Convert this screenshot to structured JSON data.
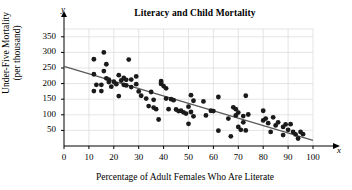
{
  "chart_data": {
    "type": "scatter",
    "title": "Literacy and Child Mortality",
    "xlabel": "Percentage of Adult Females Who Are Literate",
    "ylabel_line1": "Under-Five Mortality",
    "ylabel_line2": "(per thousand)",
    "x_axis_name": "x",
    "y_axis_name": "y",
    "xlim": [
      0,
      100
    ],
    "ylim": [
      0,
      375
    ],
    "xticks": [
      0,
      10,
      20,
      30,
      40,
      50,
      60,
      70,
      80,
      90,
      100
    ],
    "xtick_labels": [
      "0",
      "10",
      "20",
      "30",
      "40",
      "50",
      "60",
      "70",
      "80",
      "90",
      "100"
    ],
    "yticks": [
      50,
      100,
      150,
      200,
      250,
      300,
      350
    ],
    "ytick_labels": [
      "50",
      "100",
      "150",
      "200",
      "250",
      "300",
      "350"
    ],
    "y_origin_label": "0",
    "grid": true,
    "grid_color": "#d9d9d9",
    "point_color": "#1a1a1a",
    "point_radius": 2.4,
    "trendline": {
      "label": "least-squares regression line",
      "color": "#595959",
      "x_start": 0,
      "y_start": 255,
      "x_end": 100,
      "y_end": 18
    },
    "points": [
      [
        12,
        278
      ],
      [
        12,
        176
      ],
      [
        12,
        230
      ],
      [
        13,
        196
      ],
      [
        15,
        196
      ],
      [
        15,
        176
      ],
      [
        16,
        300
      ],
      [
        16,
        240
      ],
      [
        17,
        262
      ],
      [
        17,
        217
      ],
      [
        18,
        213
      ],
      [
        18,
        205
      ],
      [
        19,
        190
      ],
      [
        20,
        206
      ],
      [
        21,
        198
      ],
      [
        22,
        160
      ],
      [
        22,
        227
      ],
      [
        23,
        210
      ],
      [
        24,
        218
      ],
      [
        24,
        196
      ],
      [
        25,
        212
      ],
      [
        25,
        194
      ],
      [
        26,
        277
      ],
      [
        27,
        213
      ],
      [
        27,
        189
      ],
      [
        29,
        223
      ],
      [
        29,
        198
      ],
      [
        30,
        175
      ],
      [
        31,
        161
      ],
      [
        33,
        152
      ],
      [
        34,
        128
      ],
      [
        35,
        173
      ],
      [
        36,
        148
      ],
      [
        36,
        123
      ],
      [
        37,
        118
      ],
      [
        38,
        85
      ],
      [
        39,
        208
      ],
      [
        39,
        199
      ],
      [
        39,
        203
      ],
      [
        40,
        192
      ],
      [
        41,
        185
      ],
      [
        41,
        152
      ],
      [
        42,
        118
      ],
      [
        43,
        150
      ],
      [
        44,
        147
      ],
      [
        45,
        117
      ],
      [
        46,
        112
      ],
      [
        47,
        113
      ],
      [
        48,
        108
      ],
      [
        49,
        104
      ],
      [
        50,
        126
      ],
      [
        50,
        71
      ],
      [
        51,
        163
      ],
      [
        51,
        109
      ],
      [
        52,
        145
      ],
      [
        52,
        95
      ],
      [
        56,
        143
      ],
      [
        57,
        98
      ],
      [
        59,
        113
      ],
      [
        60,
        112
      ],
      [
        62,
        157
      ],
      [
        62,
        49
      ],
      [
        66,
        88
      ],
      [
        67,
        31
      ],
      [
        68,
        124
      ],
      [
        69,
        118
      ],
      [
        69,
        98
      ],
      [
        70,
        107
      ],
      [
        70,
        61
      ],
      [
        71,
        52
      ],
      [
        72,
        76
      ],
      [
        72,
        96
      ],
      [
        73,
        161
      ],
      [
        73,
        50
      ],
      [
        74,
        101
      ],
      [
        80,
        113
      ],
      [
        80,
        82
      ],
      [
        81,
        88
      ],
      [
        82,
        73
      ],
      [
        83,
        45
      ],
      [
        84,
        92
      ],
      [
        85,
        66
      ],
      [
        86,
        76
      ],
      [
        88,
        61
      ],
      [
        88,
        35
      ],
      [
        89,
        69
      ],
      [
        90,
        52
      ],
      [
        91,
        70
      ],
      [
        92,
        45
      ],
      [
        93,
        37
      ],
      [
        94,
        24
      ],
      [
        95,
        45
      ],
      [
        96,
        38
      ]
    ]
  }
}
